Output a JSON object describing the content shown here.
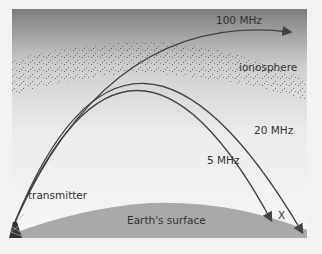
{
  "diagram": {
    "labels": {
      "mhz100": "100 MHz",
      "ionosphere": "ionosphere",
      "mhz20": "20 MHz",
      "mhz5": "5 MHz",
      "transmitter": "transmitter",
      "earth": "Earth's surface",
      "skip": "X"
    },
    "colors": {
      "sky_top": "#7a7a7a",
      "sky_bottom": "#f4f4f4",
      "earth": "#a8a8a8",
      "rays": "#4a4a4a",
      "dots": "#555555"
    }
  }
}
